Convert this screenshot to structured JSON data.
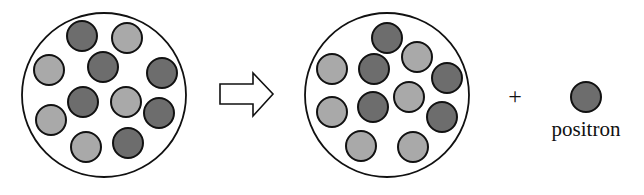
{
  "diagram": {
    "colors": {
      "background": "#ffffff",
      "outline": "#111111",
      "proton_light": "#a9a9a9",
      "neutron_dark": "#6d6d6d"
    },
    "nucleus_before": {
      "center": [
        104,
        95
      ],
      "radius": 82,
      "particles": [
        {
          "x": 82,
          "y": 36,
          "type": "dark"
        },
        {
          "x": 127,
          "y": 38,
          "type": "light"
        },
        {
          "x": 49,
          "y": 70,
          "type": "light"
        },
        {
          "x": 103,
          "y": 67,
          "type": "dark"
        },
        {
          "x": 162,
          "y": 73,
          "type": "dark"
        },
        {
          "x": 83,
          "y": 102,
          "type": "dark"
        },
        {
          "x": 126,
          "y": 102,
          "type": "light"
        },
        {
          "x": 159,
          "y": 113,
          "type": "dark"
        },
        {
          "x": 51,
          "y": 120,
          "type": "light"
        },
        {
          "x": 86,
          "y": 147,
          "type": "light"
        },
        {
          "x": 128,
          "y": 143,
          "type": "dark"
        }
      ]
    },
    "arrow": {
      "direction": "right",
      "style": "hollow"
    },
    "nucleus_after": {
      "center": [
        387,
        95
      ],
      "radius": 82,
      "particles": [
        {
          "x": 387,
          "y": 38,
          "type": "dark"
        },
        {
          "x": 417,
          "y": 57,
          "type": "light"
        },
        {
          "x": 332,
          "y": 69,
          "type": "light"
        },
        {
          "x": 374,
          "y": 69,
          "type": "dark"
        },
        {
          "x": 447,
          "y": 78,
          "type": "dark"
        },
        {
          "x": 409,
          "y": 97,
          "type": "light"
        },
        {
          "x": 332,
          "y": 112,
          "type": "light"
        },
        {
          "x": 373,
          "y": 107,
          "type": "dark"
        },
        {
          "x": 442,
          "y": 117,
          "type": "dark"
        },
        {
          "x": 361,
          "y": 146,
          "type": "light"
        },
        {
          "x": 413,
          "y": 147,
          "type": "light"
        }
      ]
    },
    "plus_sign": "+",
    "emitted_particle": {
      "x": 586,
      "y": 97,
      "type": "dark",
      "label": "positron"
    },
    "particle_radius": 15
  }
}
